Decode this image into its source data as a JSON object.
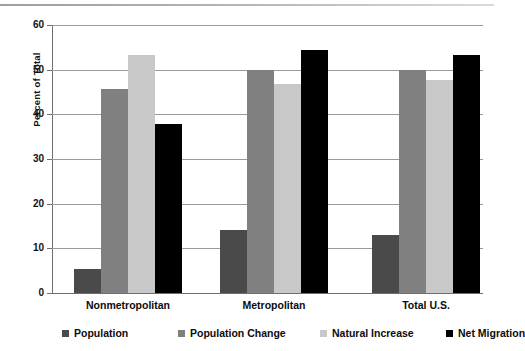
{
  "chart_data": {
    "type": "bar",
    "title": "",
    "subtitle": "",
    "xlabel": "",
    "ylabel": "Percent of Total",
    "ylim": [
      0,
      60
    ],
    "yticks": [
      0,
      10,
      20,
      30,
      40,
      50,
      60
    ],
    "ytick_labels": [
      "0",
      "10",
      "20",
      "30",
      "40",
      "50",
      "60"
    ],
    "grid": true,
    "legend_position": "bottom",
    "categories": [
      "Nonmetropolitan",
      "Metropolitan",
      "Total U.S."
    ],
    "series": [
      {
        "name": "Population",
        "color": "#4a4a4a",
        "values": [
          5.4,
          14.2,
          12.9
        ]
      },
      {
        "name": "Population Change",
        "color": "#808080",
        "values": [
          45.6,
          49.9,
          50.0
        ]
      },
      {
        "name": "Natural Increase",
        "color": "#c8c8c8",
        "values": [
          53.3,
          46.9,
          47.8
        ]
      },
      {
        "name": "Net Migration",
        "color": "#000000",
        "values": [
          37.9,
          54.4,
          53.2
        ]
      }
    ]
  },
  "axis": {
    "y_title": "Percent of Total"
  },
  "colors": {
    "gridline": "#9a9a9a",
    "axis": "#6e6e6e",
    "background": "#ffffff",
    "text": "#0c0c0c"
  }
}
